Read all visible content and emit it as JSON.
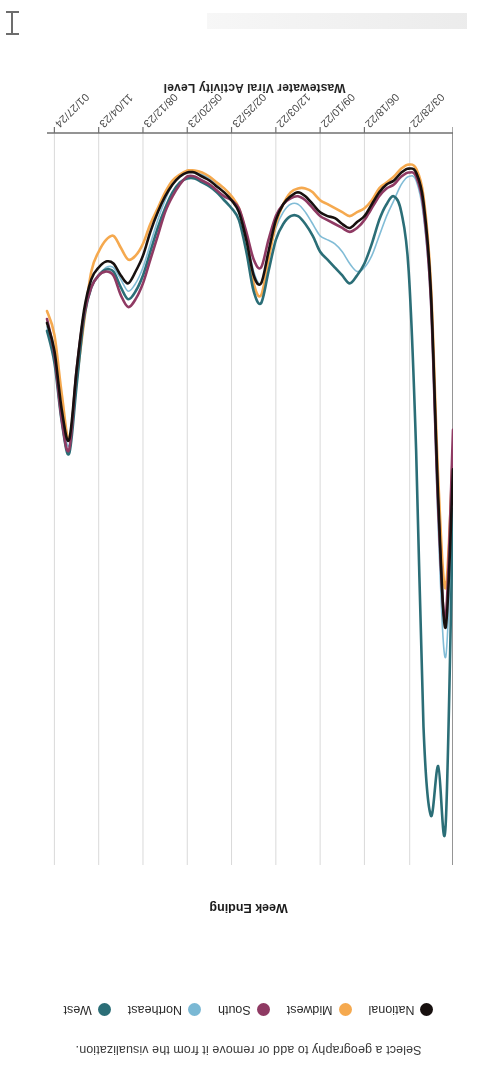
{
  "legend": {
    "hint": "Select a geography to add or remove it from the visualization.",
    "items": [
      {
        "label": "National",
        "color": "#17100f"
      },
      {
        "label": "Midwest",
        "color": "#f5a94f"
      },
      {
        "label": "South",
        "color": "#8f3a63"
      },
      {
        "label": "Northeast",
        "color": "#7ab8d4"
      },
      {
        "label": "West",
        "color": "#2b6e77"
      }
    ]
  },
  "axes": {
    "x_title": "Week Ending",
    "y_title": "Wastewater Viral Activity Level",
    "x_tick_labels": [
      "01/01/22",
      "03/28/22",
      "06/18/22",
      "09/10/22",
      "12/03/22",
      "02/25/23",
      "05/20/23",
      "08/12/23",
      "11/04/23",
      "01/27/24"
    ],
    "y_tick_labels": [
      "0",
      "5",
      "10",
      "15",
      "20",
      "25",
      "30",
      "35"
    ]
  },
  "chart_data": {
    "type": "line",
    "title": "",
    "xlabel": "Week Ending",
    "ylabel": "Wastewater Viral Activity Level",
    "xlim": [
      "01/01/22",
      "02/17/24"
    ],
    "ylim": [
      0,
      37
    ],
    "ytick_values": [
      0,
      5,
      10,
      15,
      20,
      25,
      30,
      35
    ],
    "xtick_values": [
      "01/01/22",
      "03/28/22",
      "06/18/22",
      "09/10/22",
      "12/03/22",
      "02/25/23",
      "05/20/23",
      "08/12/23",
      "11/04/23",
      "01/27/24"
    ],
    "grid": "vertical",
    "legend_position": "top",
    "x": [
      "01/01/22",
      "01/15/22",
      "01/29/22",
      "02/12/22",
      "02/26/22",
      "03/12/22",
      "03/26/22",
      "04/09/22",
      "04/23/22",
      "05/07/22",
      "05/21/22",
      "06/04/22",
      "06/18/22",
      "07/02/22",
      "07/16/22",
      "07/30/22",
      "08/13/22",
      "08/27/22",
      "09/10/22",
      "09/24/22",
      "10/08/22",
      "10/22/22",
      "11/05/22",
      "11/19/22",
      "12/03/22",
      "12/17/22",
      "12/31/22",
      "01/14/23",
      "01/28/23",
      "02/11/23",
      "02/25/23",
      "03/11/23",
      "03/25/23",
      "04/08/23",
      "04/22/23",
      "05/06/23",
      "05/20/23",
      "06/03/23",
      "06/17/23",
      "07/01/23",
      "07/15/23",
      "07/29/23",
      "08/12/23",
      "08/26/23",
      "09/09/23",
      "09/23/23",
      "10/07/23",
      "10/21/23",
      "11/04/23",
      "11/18/23",
      "12/02/23",
      "12/16/23",
      "12/30/23",
      "01/13/24",
      "01/27/24",
      "02/10/24"
    ],
    "series": [
      {
        "name": "National",
        "color": "#17100f",
        "values": [
          17.0,
          25.0,
          18.5,
          8.0,
          3.5,
          2.0,
          1.8,
          2.0,
          2.4,
          2.6,
          3.0,
          3.6,
          4.2,
          4.5,
          4.8,
          4.6,
          4.3,
          4.2,
          4.0,
          3.6,
          3.2,
          3.0,
          3.2,
          3.6,
          4.4,
          6.0,
          7.6,
          7.2,
          5.4,
          4.0,
          3.4,
          3.0,
          2.7,
          2.4,
          2.2,
          2.0,
          2.0,
          2.2,
          2.6,
          3.2,
          4.0,
          5.0,
          6.2,
          7.0,
          7.6,
          7.2,
          6.6,
          6.5,
          6.8,
          7.4,
          9.0,
          12.0,
          15.5,
          14.0,
          11.0,
          9.6
        ]
      },
      {
        "name": "Midwest",
        "color": "#f5a94f",
        "values": [
          16.0,
          23.0,
          17.5,
          7.6,
          3.2,
          1.8,
          1.6,
          1.8,
          2.2,
          2.5,
          2.8,
          3.4,
          3.8,
          4.0,
          4.2,
          4.0,
          3.8,
          3.6,
          3.4,
          3.0,
          2.8,
          2.8,
          3.0,
          3.6,
          4.6,
          6.4,
          8.2,
          7.6,
          5.2,
          3.8,
          3.2,
          2.8,
          2.5,
          2.2,
          2.0,
          1.9,
          1.9,
          2.1,
          2.4,
          3.0,
          3.8,
          4.6,
          5.6,
          6.2,
          6.4,
          5.8,
          5.2,
          5.4,
          6.0,
          7.0,
          9.6,
          12.5,
          15.5,
          13.2,
          10.2,
          9.0
        ]
      },
      {
        "name": "South",
        "color": "#8f3a63",
        "values": [
          15.0,
          24.5,
          19.0,
          8.4,
          3.8,
          2.2,
          2.0,
          2.2,
          2.6,
          2.8,
          3.2,
          3.8,
          4.4,
          4.8,
          5.0,
          4.8,
          4.6,
          4.4,
          4.2,
          3.8,
          3.4,
          3.2,
          3.3,
          3.6,
          4.2,
          5.4,
          6.8,
          6.4,
          5.0,
          3.8,
          3.4,
          3.2,
          2.9,
          2.6,
          2.4,
          2.2,
          2.2,
          2.6,
          3.2,
          4.0,
          5.2,
          6.4,
          7.6,
          8.4,
          8.8,
          8.2,
          7.2,
          7.0,
          7.2,
          7.8,
          9.2,
          12.0,
          16.0,
          14.5,
          11.2,
          9.4
        ]
      },
      {
        "name": "Northeast",
        "color": "#7ab8d4",
        "values": [
          18.0,
          26.5,
          20.0,
          8.8,
          4.2,
          2.4,
          2.2,
          2.6,
          3.4,
          4.2,
          5.2,
          6.2,
          6.8,
          7.0,
          6.6,
          6.0,
          5.6,
          5.4,
          5.2,
          4.6,
          4.0,
          3.6,
          3.6,
          4.0,
          4.8,
          6.2,
          7.6,
          7.0,
          5.2,
          3.8,
          3.2,
          2.8,
          2.6,
          2.3,
          2.1,
          2.0,
          2.0,
          2.2,
          2.6,
          3.4,
          4.4,
          5.6,
          6.8,
          7.6,
          8.0,
          7.4,
          6.8,
          6.8,
          7.2,
          7.8,
          9.4,
          12.6,
          15.8,
          14.2,
          11.4,
          9.8
        ]
      },
      {
        "name": "West",
        "color": "#2b6e77",
        "values": [
          19.0,
          35.0,
          32.0,
          34.5,
          30.0,
          16.0,
          7.0,
          4.0,
          3.2,
          3.6,
          4.4,
          5.6,
          6.6,
          7.2,
          7.6,
          7.2,
          6.8,
          6.4,
          6.0,
          5.2,
          4.6,
          4.2,
          4.2,
          4.6,
          5.4,
          7.0,
          8.6,
          8.0,
          6.0,
          4.4,
          3.8,
          3.4,
          3.0,
          2.7,
          2.5,
          2.3,
          2.3,
          2.5,
          3.0,
          3.8,
          4.8,
          6.0,
          7.2,
          8.0,
          8.4,
          7.8,
          7.0,
          6.9,
          7.2,
          7.8,
          9.4,
          12.8,
          16.2,
          14.6,
          11.6,
          10.0
        ]
      }
    ]
  }
}
